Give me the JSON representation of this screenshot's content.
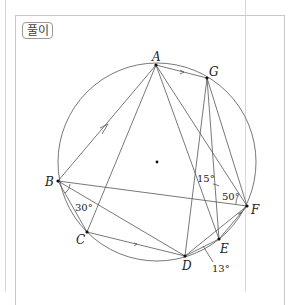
{
  "header": {
    "label": "풀이"
  },
  "diagram": {
    "points": {
      "A": "A",
      "B": "B",
      "C": "C",
      "D": "D",
      "E": "E",
      "F": "F",
      "G": "G"
    },
    "angles": {
      "angle_B": "30°",
      "angle_15": "15°",
      "angle_F": "50°",
      "angle_D": "13°"
    }
  }
}
